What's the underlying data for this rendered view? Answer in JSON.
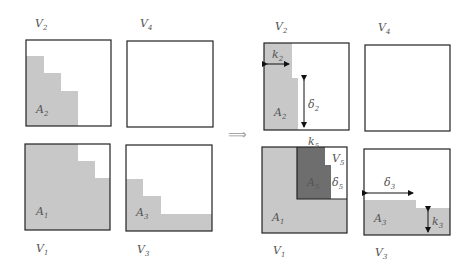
{
  "diagram": {
    "implies_symbol": "⟹",
    "colors": {
      "region_fill": "#c8c8c8",
      "dark_region_fill": "#6e6e6e",
      "border": "#222222"
    },
    "left": {
      "V2": {
        "label": "V",
        "sub": "2",
        "region": {
          "label": "A",
          "sub": "2"
        }
      },
      "V4": {
        "label": "V",
        "sub": "4"
      },
      "V1": {
        "label": "V",
        "sub": "1",
        "region": {
          "label": "A",
          "sub": "1"
        }
      },
      "V3": {
        "label": "V",
        "sub": "3",
        "region": {
          "label": "A",
          "sub": "3"
        }
      }
    },
    "right": {
      "V2": {
        "label": "V",
        "sub": "2",
        "region": {
          "label": "A",
          "sub": "2"
        },
        "k": {
          "label": "k",
          "sub": "2"
        },
        "delta": {
          "label": "δ",
          "sub": "2"
        }
      },
      "V4": {
        "label": "V",
        "sub": "4"
      },
      "V1": {
        "label": "V",
        "sub": "1",
        "region": {
          "label": "A",
          "sub": "1"
        },
        "inner_region": {
          "label": "A",
          "sub": "5"
        },
        "V5": {
          "label": "V",
          "sub": "5"
        },
        "k": {
          "label": "k",
          "sub": "5"
        },
        "delta": {
          "label": "δ",
          "sub": "5"
        }
      },
      "V3": {
        "label": "V",
        "sub": "3",
        "region": {
          "label": "A",
          "sub": "3"
        },
        "k": {
          "label": "k",
          "sub": "3"
        },
        "delta": {
          "label": "δ",
          "sub": "3"
        }
      }
    }
  }
}
